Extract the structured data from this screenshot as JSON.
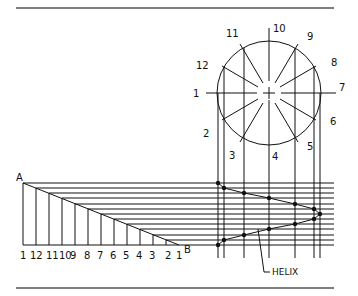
{
  "figure": {
    "point_a_label": "A",
    "point_b_label": "B",
    "curve_label": "HELIX",
    "circle_labels": [
      "1",
      "2",
      "3",
      "4",
      "5",
      "6",
      "7",
      "8",
      "9",
      "10",
      "11",
      "12"
    ],
    "baseline_labels": [
      "1",
      "12",
      "11",
      "10",
      "9",
      "8",
      "7",
      "6",
      "5",
      "4",
      "3",
      "2",
      "1"
    ]
  },
  "colors": {
    "line": "#111111",
    "rule": "#555555",
    "background": "#ffffff"
  }
}
